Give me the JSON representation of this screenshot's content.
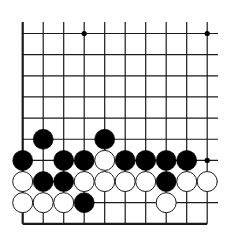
{
  "board": {
    "cols": 10,
    "rows": 10,
    "x0": 22.7,
    "y0": 33.5,
    "dx": 20.5,
    "dy": 21.15,
    "vertical_top": 22,
    "horizontal_right": 218,
    "stone_radius": 10,
    "edges": {
      "left": "solid",
      "bottom": "solid",
      "top": "open",
      "right": "open"
    },
    "colors": {
      "background": "#ffffff",
      "line": "#1a1a1a",
      "black_stone": "#000000",
      "white_stone_fill": "#ffffff",
      "white_stone_stroke": "#1a1a1a",
      "star_point": "#000000"
    }
  },
  "star_points": [
    {
      "col": 3,
      "row": 0
    },
    {
      "col": 9,
      "row": 0
    },
    {
      "col": 9,
      "row": 6
    }
  ],
  "stones": [
    {
      "col": 1,
      "row": 5,
      "color": "black"
    },
    {
      "col": 4,
      "row": 5,
      "color": "black"
    },
    {
      "col": 0,
      "row": 6,
      "color": "black"
    },
    {
      "col": 2,
      "row": 6,
      "color": "black"
    },
    {
      "col": 3,
      "row": 6,
      "color": "black"
    },
    {
      "col": 4,
      "row": 6,
      "color": "white"
    },
    {
      "col": 5,
      "row": 6,
      "color": "black"
    },
    {
      "col": 6,
      "row": 6,
      "color": "black"
    },
    {
      "col": 7,
      "row": 6,
      "color": "black"
    },
    {
      "col": 8,
      "row": 6,
      "color": "black"
    },
    {
      "col": 0,
      "row": 7,
      "color": "white"
    },
    {
      "col": 1,
      "row": 7,
      "color": "black"
    },
    {
      "col": 2,
      "row": 7,
      "color": "black"
    },
    {
      "col": 3,
      "row": 7,
      "color": "white"
    },
    {
      "col": 4,
      "row": 7,
      "color": "white"
    },
    {
      "col": 5,
      "row": 7,
      "color": "white"
    },
    {
      "col": 6,
      "row": 7,
      "color": "white"
    },
    {
      "col": 7,
      "row": 7,
      "color": "black"
    },
    {
      "col": 8,
      "row": 7,
      "color": "white"
    },
    {
      "col": 9,
      "row": 7,
      "color": "white"
    },
    {
      "col": 0,
      "row": 8,
      "color": "white"
    },
    {
      "col": 1,
      "row": 8,
      "color": "white"
    },
    {
      "col": 2,
      "row": 8,
      "color": "white"
    },
    {
      "col": 3,
      "row": 8,
      "color": "black"
    },
    {
      "col": 7,
      "row": 8,
      "color": "white"
    }
  ]
}
